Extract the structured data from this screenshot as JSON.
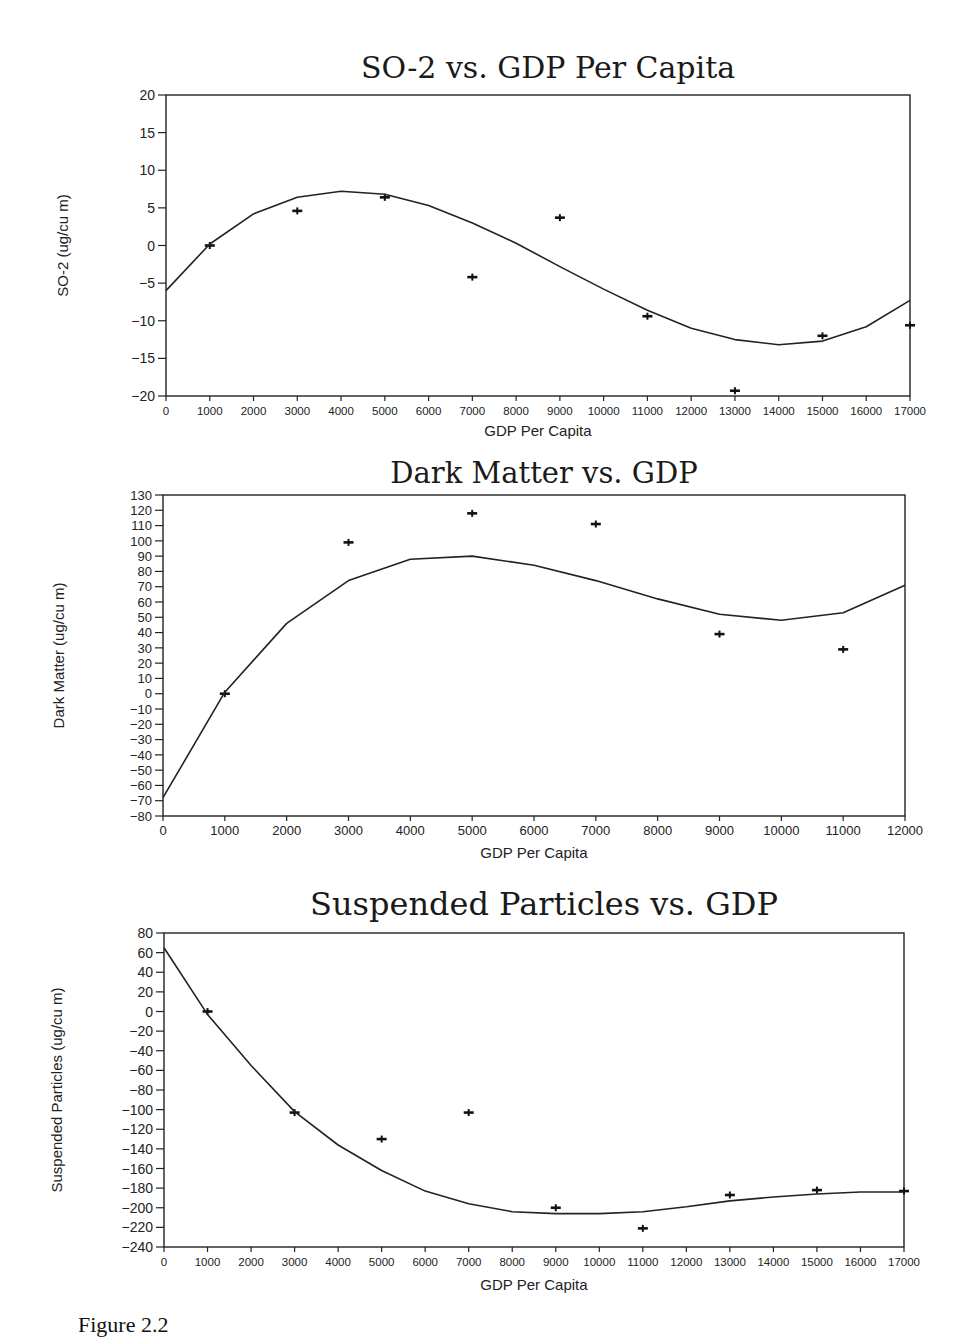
{
  "figure": {
    "caption": "Figure 2.2"
  },
  "chart_data": [
    {
      "type": "scatter",
      "title": "SO-2 vs. GDP Per Capita",
      "xlabel": "GDP Per Capita",
      "ylabel": "SO-2 (ug/cu m)",
      "xlim": [
        0,
        17000
      ],
      "ylim": [
        -20,
        20
      ],
      "xticks": [
        0,
        1000,
        2000,
        3000,
        4000,
        5000,
        6000,
        7000,
        8000,
        9000,
        10000,
        11000,
        12000,
        13000,
        14000,
        15000,
        16000,
        17000
      ],
      "yticks": [
        -20,
        -15,
        -10,
        -5,
        0,
        5,
        10,
        15,
        20
      ],
      "grid": false,
      "legend": null,
      "series": [
        {
          "name": "observed",
          "kind": "points",
          "marker": "+",
          "x": [
            1000,
            3000,
            5000,
            7000,
            9000,
            11000,
            13000,
            15000,
            17000
          ],
          "y": [
            0,
            4.6,
            6.4,
            -4.2,
            3.7,
            -9.4,
            -19.3,
            -12,
            -10.6
          ]
        },
        {
          "name": "fitted",
          "kind": "line",
          "x": [
            0,
            1000,
            2000,
            3000,
            4000,
            5000,
            6000,
            7000,
            8000,
            9000,
            10000,
            11000,
            12000,
            13000,
            14000,
            15000,
            16000,
            17000
          ],
          "y": [
            -6,
            0.2,
            4.2,
            6.4,
            7.2,
            6.8,
            5.3,
            3.0,
            0.3,
            -2.8,
            -5.8,
            -8.6,
            -11,
            -12.5,
            -13.2,
            -12.7,
            -10.8,
            -7.3
          ]
        }
      ]
    },
    {
      "type": "scatter",
      "title": "Dark Matter vs. GDP",
      "xlabel": "GDP Per Capita",
      "ylabel": "Dark Matter (ug/cu m)",
      "xlim": [
        0,
        12000
      ],
      "ylim": [
        -80,
        130
      ],
      "xticks": [
        0,
        1000,
        2000,
        3000,
        4000,
        5000,
        6000,
        7000,
        8000,
        9000,
        10000,
        11000,
        12000
      ],
      "yticks": [
        -80,
        -70,
        -60,
        -50,
        -40,
        -30,
        -20,
        -10,
        0,
        10,
        20,
        30,
        40,
        50,
        60,
        70,
        80,
        90,
        100,
        110,
        120,
        130
      ],
      "grid": false,
      "legend": null,
      "series": [
        {
          "name": "observed",
          "kind": "points",
          "marker": "+",
          "x": [
            1000,
            3000,
            5000,
            7000,
            9000,
            11000
          ],
          "y": [
            0,
            99,
            118,
            111,
            39,
            29
          ]
        },
        {
          "name": "fitted",
          "kind": "line",
          "x": [
            0,
            1000,
            2000,
            3000,
            4000,
            5000,
            6000,
            7000,
            8000,
            9000,
            10000,
            11000,
            12000
          ],
          "y": [
            -68,
            1,
            46,
            74,
            88,
            90,
            84,
            74,
            62,
            52,
            48,
            53,
            71
          ]
        }
      ]
    },
    {
      "type": "scatter",
      "title": "Suspended Particles vs. GDP",
      "xlabel": "GDP Per Capita",
      "ylabel": "Suspended Particles (ug/cu m)",
      "xlim": [
        0,
        17000
      ],
      "ylim": [
        -240,
        80
      ],
      "xticks": [
        0,
        1000,
        2000,
        3000,
        4000,
        5000,
        6000,
        7000,
        8000,
        9000,
        10000,
        11000,
        12000,
        13000,
        14000,
        15000,
        16000,
        17000
      ],
      "yticks": [
        -240,
        -220,
        -200,
        -180,
        -160,
        -140,
        -120,
        -100,
        -80,
        -60,
        -40,
        -20,
        0,
        20,
        40,
        60,
        80
      ],
      "grid": false,
      "legend": null,
      "series": [
        {
          "name": "observed",
          "kind": "points",
          "marker": "+",
          "x": [
            1000,
            3000,
            5000,
            7000,
            9000,
            11000,
            13000,
            15000,
            17000
          ],
          "y": [
            0,
            -103,
            -130,
            -103,
            -200,
            -221,
            -187,
            -182,
            -183
          ]
        },
        {
          "name": "fitted",
          "kind": "line",
          "x": [
            0,
            1000,
            2000,
            3000,
            4000,
            5000,
            6000,
            7000,
            8000,
            9000,
            10000,
            11000,
            12000,
            13000,
            14000,
            15000,
            16000,
            17000
          ],
          "y": [
            65,
            -3,
            -55,
            -102,
            -136,
            -162,
            -183,
            -196,
            -204,
            -206,
            -206,
            -204,
            -199,
            -193,
            -189,
            -186,
            -184,
            -184
          ]
        }
      ]
    }
  ]
}
